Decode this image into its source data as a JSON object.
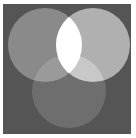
{
  "diagram": {
    "type": "venn",
    "sets": 3,
    "frame": {
      "x": 3,
      "y": 4,
      "width": 128,
      "height": 130,
      "fill": "#555555"
    },
    "circles": [
      {
        "id": "left",
        "cx": 45,
        "cy": 45,
        "r": 37,
        "fill": "#8a8a8a"
      },
      {
        "id": "right",
        "cx": 93,
        "cy": 45,
        "r": 37,
        "fill": "#b0b0b0"
      },
      {
        "id": "bottom",
        "cx": 69,
        "cy": 91,
        "r": 37,
        "fill": "#6e6e6e"
      }
    ],
    "regions": {
      "left_only": "#8a8a8a",
      "right_only": "#b0b0b0",
      "bottom_only": "#6e6e6e",
      "left_right": "#ffffff",
      "left_bottom": "#9a9a9a",
      "right_bottom": "#c8c8c8",
      "all_three": "#ffffff"
    }
  }
}
